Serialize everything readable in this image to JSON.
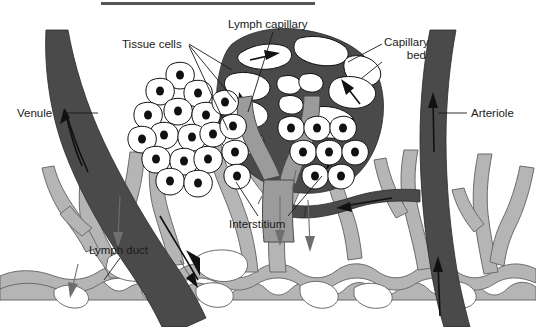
{
  "figure": {
    "title_rule": "top-horizontal-rule",
    "background_color": "#ffffff"
  },
  "palette": {
    "blood_vessel_dark": "#4a4a4a",
    "lymph_light_gray": "#b5b5b5",
    "cell_fill": "#ffffff",
    "outline": "#111111",
    "label_text": "#1a1a1a"
  },
  "labels": {
    "tissue_cells": "Tissue cells",
    "lymph_capillary": "Lymph capillary",
    "capillary_bed": "Capillary bed",
    "capillary_bed_line1": "Capillary",
    "capillary_bed_line2": "bed",
    "venule": "Venule",
    "arteriole": "Arteriole",
    "interstitium": "Interstitium",
    "lymph_duct": "Lymph duct"
  },
  "structures": [
    {
      "name": "venule",
      "color": "#4a4a4a",
      "flow_direction": "upward"
    },
    {
      "name": "arteriole",
      "color": "#4a4a4a",
      "flow_direction": "upward"
    },
    {
      "name": "capillary-bed",
      "color": "#4a4a4a"
    },
    {
      "name": "lymph-capillary",
      "color": "#b5b5b5"
    },
    {
      "name": "lymph-duct-network",
      "color": "#b5b5b5"
    },
    {
      "name": "tissue-cell-cluster",
      "color": "#ffffff"
    },
    {
      "name": "interstitium",
      "color": "#ffffff"
    }
  ]
}
